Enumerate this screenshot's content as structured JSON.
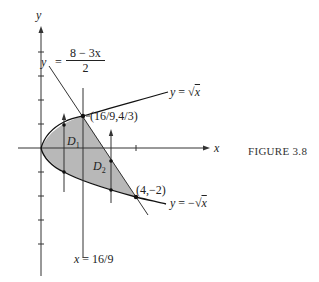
{
  "figure": {
    "caption": "FIGURE 3.8",
    "axes": {
      "x_label": "x",
      "y_label": "y",
      "unit_px": 24,
      "origin_px": [
        41,
        148
      ],
      "y_ticks": [
        4,
        3,
        2,
        1,
        -1,
        -2,
        -3,
        -4
      ],
      "x_ticks": [
        4
      ]
    },
    "curves": {
      "upper": {
        "label": "y = √x",
        "lhs": "y",
        "eq": "=",
        "rhs": "x"
      },
      "lower": {
        "label": "y = −√x",
        "lhs": "y",
        "eq": "=",
        "rhs": "x",
        "sign": "−"
      },
      "line": {
        "label": "y = (8 − 3x)/2",
        "lhs": "y",
        "eq": "=",
        "numerator": "8 − 3x",
        "denominator": "2"
      }
    },
    "vertical_line": {
      "label": "x = 16/9",
      "lhs": "x",
      "eq": "=",
      "rhs": "16/9"
    },
    "points": [
      {
        "label": "(16/9,4/3)",
        "x": 1.7778,
        "y": 1.3333
      },
      {
        "label": "(4,−2)",
        "x": 4,
        "y": -2
      }
    ],
    "regions": [
      {
        "name": "D",
        "sub": "1"
      },
      {
        "name": "D",
        "sub": "2"
      }
    ],
    "colors": {
      "ink": "#222222",
      "shade": "#b8b8b8",
      "background": "#ffffff"
    }
  }
}
